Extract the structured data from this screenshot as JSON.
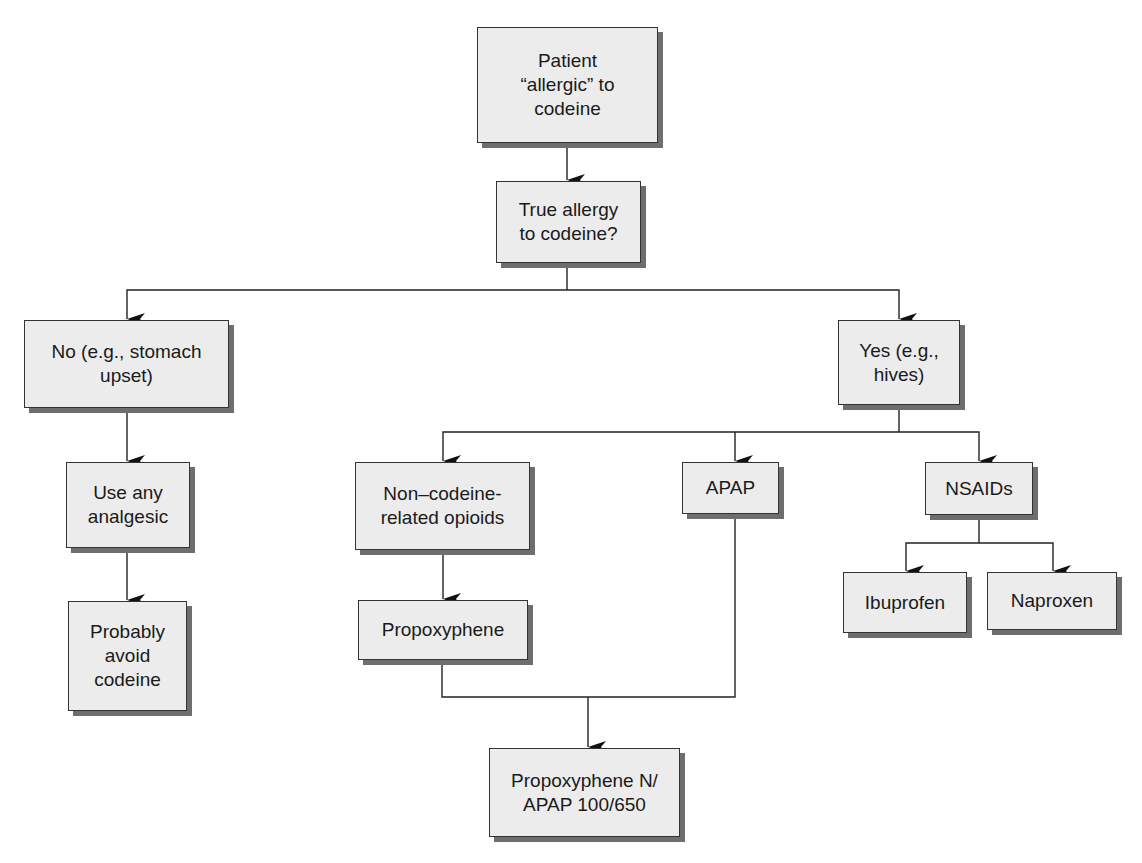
{
  "diagram": {
    "type": "flowchart",
    "nodes": {
      "start": "Patient\n“allergic” to\ncodeine",
      "question": "True allergy\nto codeine?",
      "no": "No (e.g., stomach\nupset)",
      "use_any": "Use any\nanalgesic",
      "avoid": "Probably\navoid\ncodeine",
      "yes": "Yes (e.g.,\nhives)",
      "non_codeine": "Non–codeine-\nrelated opioids",
      "apap": "APAP",
      "nsaids": "NSAIDs",
      "ibuprofen": "Ibuprofen",
      "naproxen": "Naproxen",
      "propoxyphene": "Propoxyphene",
      "combo": "Propoxyphene N/\nAPAP 100/650"
    },
    "edges": [
      [
        "start",
        "question"
      ],
      [
        "question",
        "no"
      ],
      [
        "question",
        "yes"
      ],
      [
        "no",
        "use_any"
      ],
      [
        "use_any",
        "avoid"
      ],
      [
        "yes",
        "non_codeine"
      ],
      [
        "yes",
        "apap"
      ],
      [
        "yes",
        "nsaids"
      ],
      [
        "nsaids",
        "ibuprofen"
      ],
      [
        "nsaids",
        "naproxen"
      ],
      [
        "non_codeine",
        "propoxyphene"
      ],
      [
        "propoxyphene",
        "combo"
      ],
      [
        "apap",
        "combo"
      ]
    ],
    "colors": {
      "box_fill": "#ececec",
      "box_border": "#333333",
      "box_shadow": "#6e6e6e",
      "line": "#222222"
    }
  }
}
